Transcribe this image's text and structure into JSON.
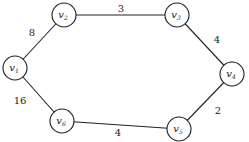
{
  "diagram": {
    "type": "weighted-undirected-graph",
    "node_radius": 12,
    "colors": {
      "stroke": "#222222",
      "fill": "#ffffff",
      "text": "#222222"
    },
    "nodes": [
      {
        "id": "v1",
        "base": "v",
        "sub": "1",
        "x": 15,
        "y": 68
      },
      {
        "id": "v2",
        "base": "v",
        "sub": "2",
        "x": 64,
        "y": 15
      },
      {
        "id": "v3",
        "base": "v",
        "sub": "3",
        "x": 177,
        "y": 15
      },
      {
        "id": "v4",
        "base": "v",
        "sub": "4",
        "x": 232,
        "y": 74
      },
      {
        "id": "v5",
        "base": "v",
        "sub": "5",
        "x": 179,
        "y": 129
      },
      {
        "id": "v6",
        "base": "v",
        "sub": "6",
        "x": 62,
        "y": 121
      }
    ],
    "edges": [
      {
        "from": "v1",
        "to": "v2",
        "weight": "8",
        "lx": 32,
        "ly": 36
      },
      {
        "from": "v2",
        "to": "v3",
        "weight": "3",
        "lx": 121,
        "ly": 12
      },
      {
        "from": "v3",
        "to": "v4",
        "weight": "4",
        "lx": 217,
        "ly": 43
      },
      {
        "from": "v4",
        "to": "v5",
        "weight": "2",
        "lx": 218,
        "ly": 114
      },
      {
        "from": "v5",
        "to": "v6",
        "weight": "4",
        "lx": 118,
        "ly": 136
      },
      {
        "from": "v6",
        "to": "v1",
        "weight": "16",
        "lx": 20,
        "ly": 104
      }
    ]
  }
}
